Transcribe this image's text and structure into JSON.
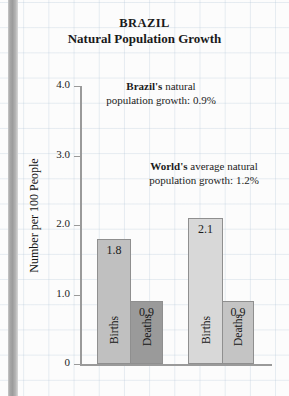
{
  "chart_data": {
    "type": "bar",
    "title": "BRAZIL",
    "subtitle": "Natural Population Growth",
    "xlabel": "",
    "ylabel": "Number per 100 People",
    "ylim": [
      0,
      4.0
    ],
    "grid": true,
    "legend": "none",
    "categories": [
      "Births",
      "Deaths",
      "Births",
      "Deaths"
    ],
    "values": [
      1.8,
      0.9,
      2.1,
      0.9
    ],
    "groups": [
      {
        "name": "Brazil",
        "bars": [
          {
            "label": "Births",
            "value": 1.8,
            "value_text": "1.8",
            "color": "#c0c0c0"
          },
          {
            "label": "Deaths",
            "value": 0.9,
            "value_text": "0.9",
            "color": "#9a9a9a"
          }
        ]
      },
      {
        "name": "World",
        "bars": [
          {
            "label": "Births",
            "value": 2.1,
            "value_text": "2.1",
            "color": "#d8d8d8"
          },
          {
            "label": "Deaths",
            "value": 0.9,
            "value_text": "0.9",
            "color": "#c4c4c4"
          }
        ]
      }
    ],
    "yticks": [
      {
        "value": 4.0,
        "label": "4.0"
      },
      {
        "value": 3.0,
        "label": "3.0"
      },
      {
        "value": 2.0,
        "label": "2.0"
      },
      {
        "value": 1.0,
        "label": "1.0"
      },
      {
        "value": 0,
        "label": "0"
      }
    ],
    "annotations": [
      {
        "id": "brazil",
        "lead": "Brazil's",
        "rest": " natural",
        "line2": "population growth:  0.9%"
      },
      {
        "id": "world",
        "lead": "World's",
        "rest": " average natural",
        "line2": "population growth:  1.2%"
      }
    ]
  },
  "colors": {
    "axis": "#9a9a9a",
    "grid": "#b0c4d6",
    "text": "#1a1a1a",
    "spine": "#9c9c9c"
  }
}
